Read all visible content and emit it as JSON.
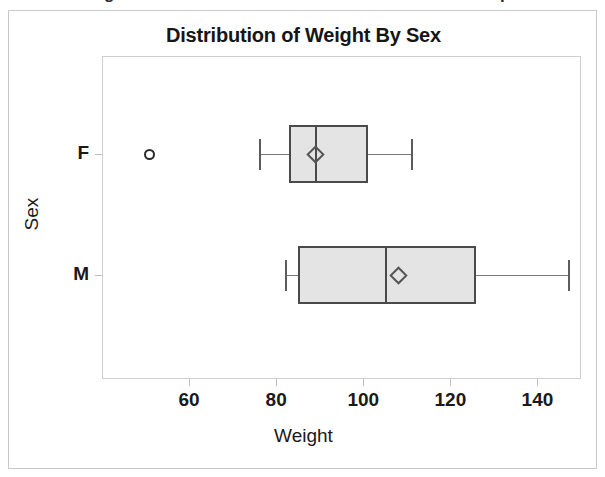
{
  "top_fragments": {
    "left": "g",
    "right": "p"
  },
  "figure": {
    "title": "Distribution of Weight By Sex",
    "xlabel": "Weight",
    "ylabel": "Sex"
  },
  "chart_data": {
    "type": "box",
    "title": "Distribution of Weight By Sex",
    "xlabel": "Weight",
    "ylabel": "Sex",
    "orientation": "horizontal",
    "grid": false,
    "legend": "none",
    "xlim": [
      40,
      150
    ],
    "xticks": [
      60,
      80,
      100,
      120,
      140
    ],
    "xticklabels": [
      "60",
      "80",
      "100",
      "120",
      "140"
    ],
    "categories": [
      "F",
      "M"
    ],
    "boxes": [
      {
        "category": "F",
        "whisker_low": 76,
        "q1": 83,
        "median": 89,
        "mean": 89,
        "q3": 101,
        "whisker_high": 111,
        "outliers": [
          51
        ]
      },
      {
        "category": "M",
        "whisker_low": 82,
        "q1": 85,
        "median": 105,
        "mean": 108,
        "q3": 126,
        "whisker_high": 147,
        "outliers": []
      }
    ]
  },
  "colors": {
    "box_fill": "#e4e4e4",
    "box_edge": "#4a4a4a",
    "whisker": "#7a7a7a",
    "frame": "#cfcfcf",
    "text": "#1a1a1a"
  }
}
